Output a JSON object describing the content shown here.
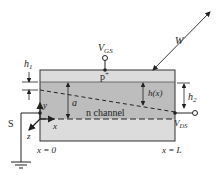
{
  "figure": {
    "colors": {
      "p_plus_layer": "#dcdcdc",
      "n_channel": "#bdbdbd",
      "substrate_layer": "#dcdcdc",
      "outline": "#333333",
      "background": "#ffffff"
    },
    "labels": {
      "vgs_main": "V",
      "vgs_sub": "GS",
      "vds_main": "V",
      "vds_sub": "DS",
      "w": "W",
      "p_plus_main": "p",
      "p_plus_sup": "+",
      "h1_main": "h",
      "h1_sub": "1",
      "h2_main": "h",
      "h2_sub": "2",
      "hx": "h(x)",
      "a": "a",
      "n_channel": "n channel",
      "source": "S",
      "axis_x": "x",
      "axis_y": "y",
      "axis_z": "z",
      "x_zero": "x = 0",
      "x_L": "x = L"
    }
  }
}
